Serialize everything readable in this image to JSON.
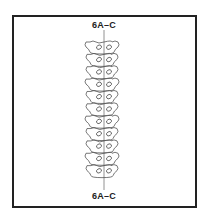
{
  "figure": {
    "top_label": "6A–C",
    "bottom_label": "6A–C",
    "vertebra_count": 11,
    "line_color": "#555555",
    "frame_color": "#222222"
  }
}
